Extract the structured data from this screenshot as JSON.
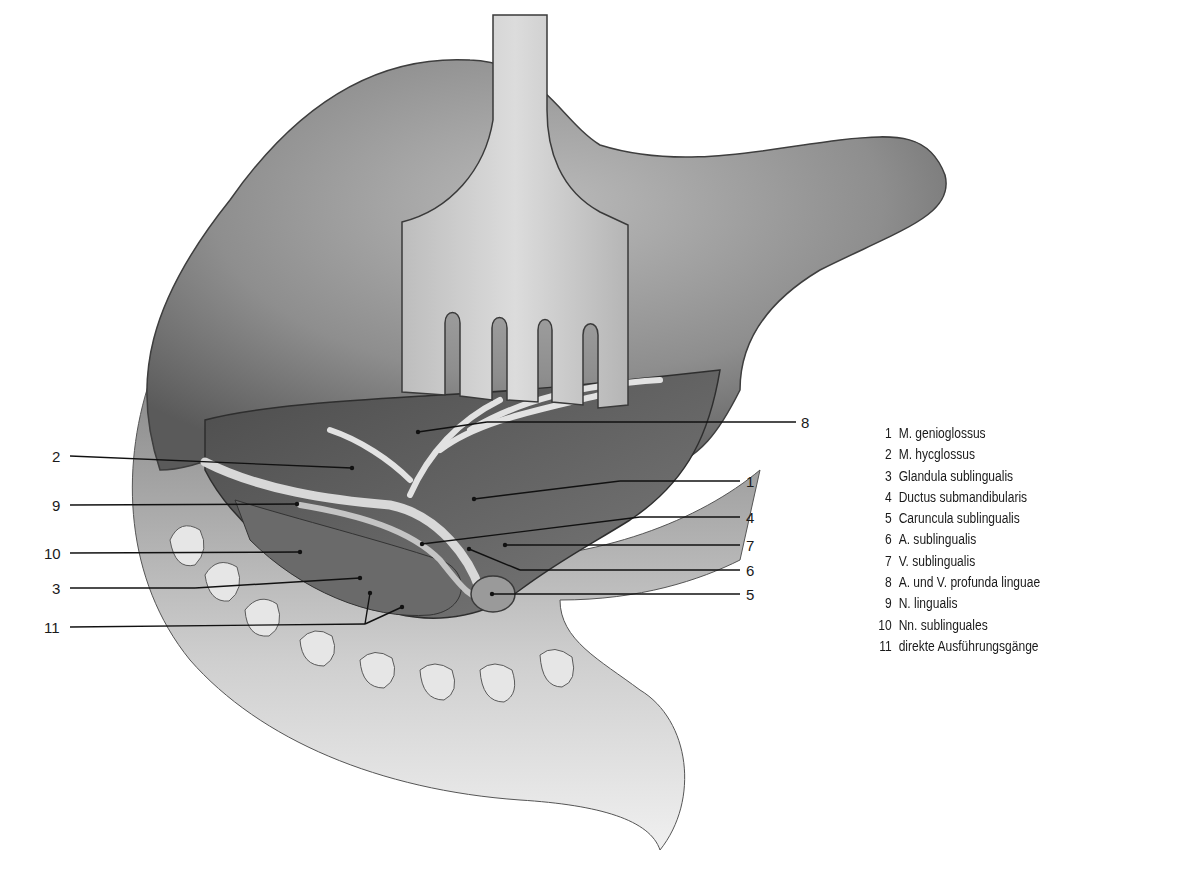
{
  "figure": {
    "style": "grayscale pencil anatomical illustration"
  },
  "legend": {
    "items": [
      {
        "num": "1",
        "text": "M. genioglossus"
      },
      {
        "num": "2",
        "text": "M. hycglossus"
      },
      {
        "num": "3",
        "text": "Glandula sublingualis"
      },
      {
        "num": "4",
        "text": "Ductus submandibularis"
      },
      {
        "num": "5",
        "text": "Caruncula sublingualis"
      },
      {
        "num": "6",
        "text": "A. sublingualis"
      },
      {
        "num": "7",
        "text": "V. sublingualis"
      },
      {
        "num": "8",
        "text": "A. und V. profunda linguae"
      },
      {
        "num": "9",
        "text": "N. lingualis"
      },
      {
        "num": "10",
        "text": "Nn. sublinguales"
      },
      {
        "num": "11",
        "text": "direkte Ausführungsgänge"
      }
    ]
  },
  "callouts": {
    "left": [
      {
        "num": "2",
        "y": 456
      },
      {
        "num": "9",
        "y": 505
      },
      {
        "num": "10",
        "y": 553
      },
      {
        "num": "3",
        "y": 588
      },
      {
        "num": "11",
        "y": 627
      }
    ],
    "right": [
      {
        "num": "8",
        "y": 422
      },
      {
        "num": "1",
        "y": 481
      },
      {
        "num": "4",
        "y": 517
      },
      {
        "num": "7",
        "y": 545
      },
      {
        "num": "6",
        "y": 570
      },
      {
        "num": "5",
        "y": 594
      }
    ]
  }
}
